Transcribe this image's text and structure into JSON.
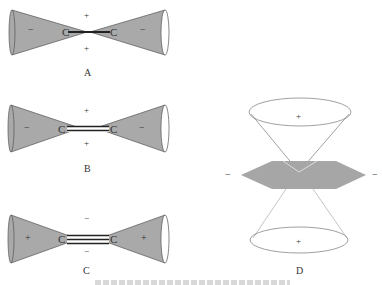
{
  "diagrams": [
    {
      "id": "A",
      "label": "A",
      "bond": "single",
      "atoms": [
        "C",
        "C"
      ],
      "cone_sign_left": "−",
      "cone_sign_right": "−",
      "center_sign_top": "+",
      "center_sign_bottom": "+"
    },
    {
      "id": "B",
      "label": "B",
      "bond": "double",
      "atoms": [
        "C",
        "C"
      ],
      "cone_sign_left": "−",
      "cone_sign_right": "−",
      "center_sign_top": "+",
      "center_sign_bottom": "+"
    },
    {
      "id": "C",
      "label": "C",
      "bond": "triple",
      "atoms": [
        "C",
        "C"
      ],
      "cone_sign_left": "+",
      "cone_sign_right": "+",
      "center_sign_top": "−",
      "center_sign_bottom": "−"
    },
    {
      "id": "D",
      "label": "D",
      "cone_sign_top": "+",
      "cone_sign_bottom": "+",
      "plane_sign_left": "−",
      "plane_sign_right": "−"
    }
  ],
  "colors": {
    "cone_fill": "#a9a9a9",
    "line": "#555555",
    "bond": "#222222",
    "plane_fill": "#a6a6a6"
  }
}
